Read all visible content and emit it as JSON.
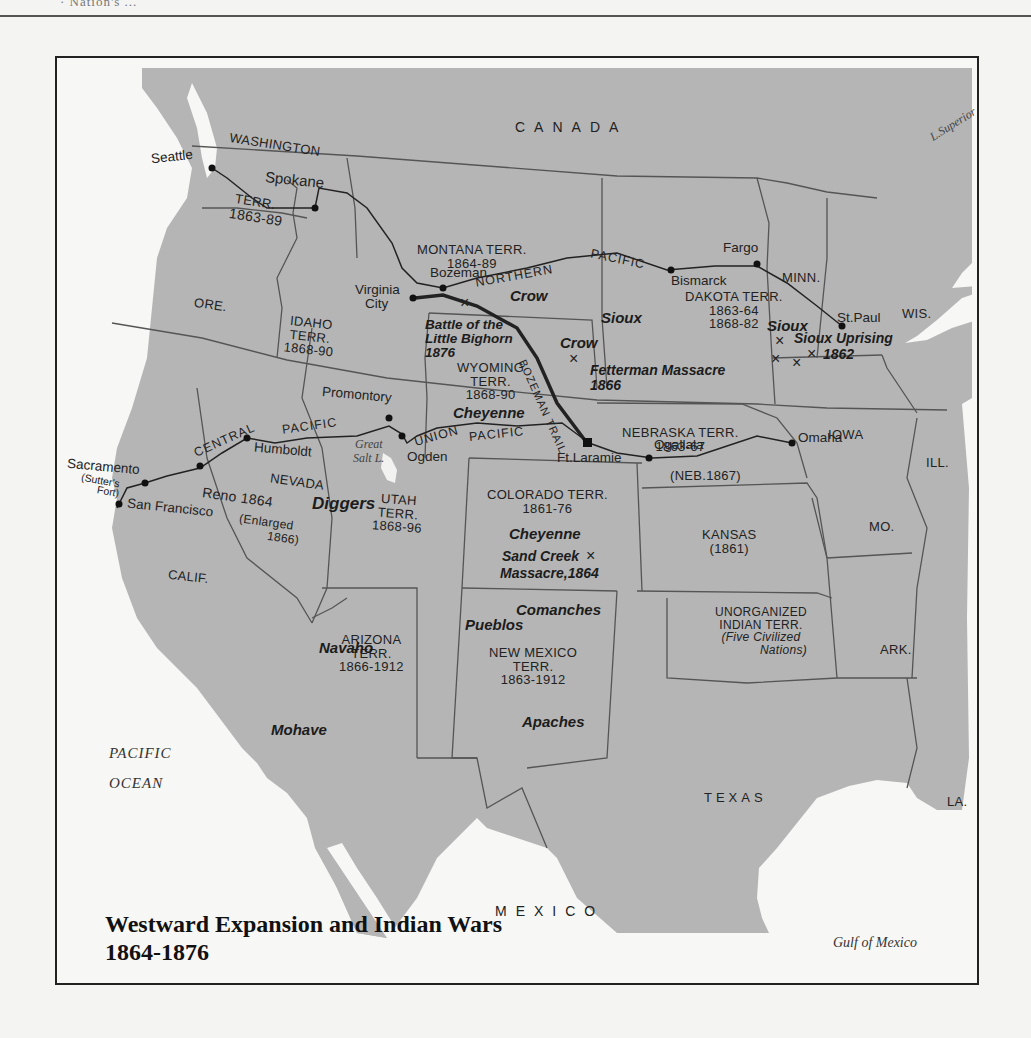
{
  "page": {
    "header_text": "· Nation's ..."
  },
  "map": {
    "title_line1": "Westward Expansion and Indian Wars",
    "title_line2": "1864-1876",
    "colors": {
      "land": "#b4b4b4",
      "water": "#f7f7f5",
      "border": "#555555",
      "rail": "#222222",
      "frame": "#222222"
    },
    "countries": {
      "canada": "CANADA",
      "mexico": "MEXICO"
    },
    "water_bodies": {
      "pacific_1": "PACIFIC",
      "pacific_2": "OCEAN",
      "gulf": "Gulf of Mexico",
      "superior": "L.Superior",
      "salt_lake_1": "Great",
      "salt_lake_2": "Salt L."
    },
    "states": {
      "washington": {
        "name": "WASHINGTON",
        "terr": "TERR.",
        "years": "1863-89"
      },
      "montana": {
        "name": "MONTANA TERR.",
        "years": "1864-89"
      },
      "dakota": {
        "name": "DAKOTA TERR.",
        "years1": "1863-64",
        "years2": "1868-82"
      },
      "minn": "MINN.",
      "wis": "WIS.",
      "ore": "ORE.",
      "idaho": {
        "name": "IDAHO",
        "terr": "TERR.",
        "years": "1868-90"
      },
      "wyoming": {
        "name": "WYOMING",
        "terr": "TERR.",
        "years": "1868-90"
      },
      "nebraska": {
        "name": "NEBRASKA TERR.",
        "years": "1863-67",
        "state": "(NEB.1867)"
      },
      "iowa": "IOWA",
      "ill": "ILL.",
      "nevada": {
        "name": "NEVADA",
        "years": "Reno 1864",
        "note1": "(Enlarged",
        "note2": "1866)"
      },
      "utah": {
        "name": "UTAH",
        "terr": "TERR.",
        "years": "1868-96"
      },
      "colorado": {
        "name": "COLORADO TERR.",
        "years": "1861-76"
      },
      "kansas": {
        "name": "KANSAS",
        "years": "(1861)"
      },
      "mo": "MO.",
      "calif": "CALIF.",
      "arizona": {
        "name": "ARIZONA",
        "terr": "TERR.",
        "years": "1866-1912"
      },
      "new_mexico": {
        "name": "NEW MEXICO",
        "terr": "TERR.",
        "years": "1863-1912"
      },
      "indian_terr": {
        "name1": "UNORGANIZED",
        "name2": "INDIAN TERR.",
        "note1": "(Five Civilized",
        "note2": "Nations)"
      },
      "ark": "ARK.",
      "texas": "TEXAS",
      "la": "LA."
    },
    "cities": {
      "seattle": "Seattle",
      "spokane": "Spokane",
      "bozeman": "Bozeman",
      "virginia_city_1": "Virginia",
      "virginia_city_2": "City",
      "bismarck": "Bismarck",
      "fargo": "Fargo",
      "st_paul": "St.Paul",
      "promontory": "Promontory",
      "ogden": "Ogden",
      "humboldt": "Humboldt",
      "sacramento": "Sacramento",
      "sutters_1": "(Sutter's",
      "sutters_2": "Fort)",
      "san_francisco": "San Francisco",
      "ft_laramie": "Ft.Laramie",
      "ogallala": "Ogallala",
      "omaha": "Omaha"
    },
    "railroads": {
      "northern": "NORTHERN",
      "northern_pacific": "PACIFIC",
      "central": "CENTRAL",
      "central_pacific": "PACIFIC",
      "union": "UNION",
      "union_pacific": "PACIFIC",
      "bozeman_trail": "BOZEMAN TRAIL"
    },
    "tribes": {
      "crow_1": "Crow",
      "crow_2": "Crow",
      "sioux_1": "Sioux",
      "sioux_2": "Sioux",
      "cheyenne_1": "Cheyenne",
      "cheyenne_2": "Cheyenne",
      "diggers": "Diggers",
      "navaho": "Navaho",
      "mohave": "Mohave",
      "comanches": "Comanches",
      "pueblos": "Pueblos",
      "apaches": "Apaches"
    },
    "battles": {
      "little_bighorn": [
        "Battle of the",
        "Little Bighorn",
        "1876"
      ],
      "fetterman": [
        "Fetterman Massacre",
        "1866"
      ],
      "sioux_uprising": [
        "Sioux Uprising",
        "1862"
      ],
      "sand_creek": [
        "Sand Creek",
        "Massacre,1864"
      ],
      "x_mark": "×"
    }
  }
}
